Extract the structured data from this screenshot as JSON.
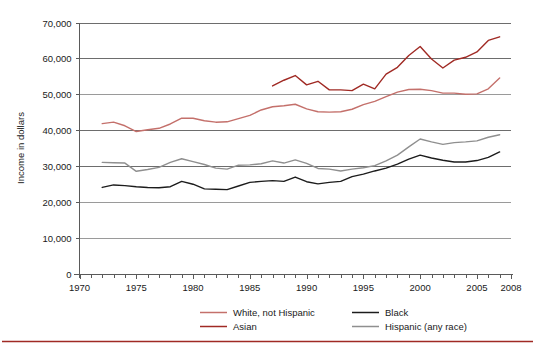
{
  "chart_data": {
    "type": "line",
    "title": "",
    "subtitle": "",
    "xlabel": "",
    "ylabel": "Income in dollars",
    "xlim": [
      1970,
      2008
    ],
    "ylim": [
      0,
      70000
    ],
    "grid": true,
    "legend_position": "bottom",
    "y_ticks": [
      "0",
      "10,000",
      "20,000",
      "30,000",
      "40,000",
      "50,000",
      "60,000",
      "70,000"
    ],
    "y_tick_values": [
      0,
      10000,
      20000,
      30000,
      40000,
      50000,
      60000,
      70000
    ],
    "x_ticks": [
      "1970",
      "1975",
      "1980",
      "1985",
      "1990",
      "1995",
      "2000",
      "2005",
      "2008"
    ],
    "x_tick_values": [
      1970,
      1975,
      1980,
      1985,
      1990,
      1995,
      2000,
      2005,
      2008
    ],
    "x_minor_step": 1,
    "series": [
      {
        "name": "White, not Hispanic",
        "color": "#c4706b",
        "x": [
          1972,
          1973,
          1974,
          1975,
          1976,
          1977,
          1978,
          1979,
          1980,
          1981,
          1982,
          1983,
          1984,
          1985,
          1986,
          1987,
          1988,
          1989,
          1990,
          1991,
          1992,
          1993,
          1994,
          1995,
          1996,
          1997,
          1998,
          1999,
          2000,
          2001,
          2002,
          2003,
          2004,
          2005,
          2006,
          2007
        ],
        "values": [
          41800,
          42200,
          41200,
          39600,
          40100,
          40500,
          41700,
          43300,
          43300,
          42600,
          42200,
          42300,
          43200,
          44100,
          45600,
          46500,
          46800,
          47200,
          45900,
          45100,
          45000,
          45100,
          45800,
          47100,
          48000,
          49300,
          50600,
          51300,
          51400,
          51000,
          50300,
          50300,
          50000,
          50100,
          51500,
          54500
        ],
        "legend_label": "White, not Hispanic"
      },
      {
        "name": "Asian",
        "color": "#a02a24",
        "x": [
          1987,
          1988,
          1989,
          1990,
          1991,
          1992,
          1993,
          1994,
          1995,
          1996,
          1997,
          1998,
          1999,
          2000,
          2001,
          2002,
          2003,
          2004,
          2005,
          2006,
          2007
        ],
        "values": [
          52300,
          53900,
          55200,
          52600,
          53600,
          51200,
          51200,
          51000,
          52800,
          51500,
          55600,
          57500,
          60800,
          63300,
          59800,
          57300,
          59500,
          60300,
          61800,
          65000,
          66000
        ],
        "legend_label": "Asian"
      },
      {
        "name": "Black",
        "color": "#1c1c1c",
        "x": [
          1972,
          1973,
          1974,
          1975,
          1976,
          1977,
          1978,
          1979,
          1980,
          1981,
          1982,
          1983,
          1984,
          1985,
          1986,
          1987,
          1988,
          1989,
          1990,
          1991,
          1992,
          1993,
          1994,
          1995,
          1996,
          1997,
          1998,
          1999,
          2000,
          2001,
          2002,
          2003,
          2004,
          2005,
          2006,
          2007
        ],
        "values": [
          24000,
          24700,
          24500,
          24200,
          24000,
          23900,
          24200,
          25700,
          24900,
          23600,
          23500,
          23400,
          24400,
          25400,
          25700,
          25900,
          25700,
          26900,
          25600,
          25000,
          25400,
          25700,
          27000,
          27700,
          28600,
          29400,
          30500,
          31900,
          33000,
          32200,
          31600,
          31100,
          31100,
          31500,
          32400,
          33900
        ],
        "legend_label": "Black"
      },
      {
        "name": "Hispanic (any race)",
        "color": "#8f8f8f",
        "x": [
          1972,
          1973,
          1974,
          1975,
          1976,
          1977,
          1978,
          1979,
          1980,
          1981,
          1982,
          1983,
          1984,
          1985,
          1986,
          1987,
          1988,
          1989,
          1990,
          1991,
          1992,
          1993,
          1994,
          1995,
          1996,
          1997,
          1998,
          1999,
          2000,
          2001,
          2002,
          2003,
          2004,
          2005,
          2006,
          2007
        ],
        "values": [
          31000,
          30900,
          30800,
          28500,
          29000,
          29600,
          31000,
          32000,
          31200,
          30400,
          29400,
          29100,
          30200,
          30300,
          30600,
          31400,
          30800,
          31700,
          30700,
          29300,
          29100,
          28600,
          29100,
          29500,
          30100,
          31400,
          33000,
          35300,
          37500,
          36700,
          36000,
          36500,
          36700,
          37000,
          38000,
          38700
        ],
        "legend_label": "Hispanic (any race)"
      }
    ],
    "legend": [
      {
        "label": "White, not Hispanic",
        "color": "#c4706b"
      },
      {
        "label": "Asian",
        "color": "#a02a24"
      },
      {
        "label": "Black",
        "color": "#1c1c1c"
      },
      {
        "label": "Hispanic (any race)",
        "color": "#8f8f8f"
      }
    ],
    "footer_rule_color": "#a02a24"
  }
}
